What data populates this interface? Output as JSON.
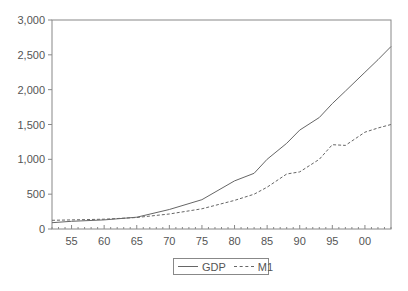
{
  "chart_data": {
    "type": "line",
    "title": "",
    "xlabel": "",
    "ylabel": "",
    "xlim": [
      1952,
      2004
    ],
    "ylim": [
      0,
      3000
    ],
    "grid": false,
    "legend_position": "bottom-center",
    "y_ticks": [
      0,
      500,
      1000,
      1500,
      2000,
      2500,
      3000
    ],
    "y_tick_labels": [
      "0",
      "500",
      "1,000",
      "1,500",
      "2,000",
      "2,500",
      "3,000"
    ],
    "x_ticks": [
      1955,
      1960,
      1965,
      1970,
      1975,
      1980,
      1985,
      1990,
      1995,
      2000
    ],
    "x_tick_labels": [
      "55",
      "60",
      "65",
      "70",
      "75",
      "80",
      "85",
      "90",
      "95",
      "00"
    ],
    "x": [
      1952,
      1955,
      1960,
      1965,
      1970,
      1975,
      1980,
      1983,
      1985,
      1988,
      1990,
      1993,
      1995,
      1997,
      2000,
      2002,
      2004
    ],
    "series": [
      {
        "name": "GDP",
        "style": "solid",
        "values": [
          90,
          110,
          130,
          170,
          280,
          420,
          690,
          800,
          1000,
          1230,
          1420,
          1600,
          1800,
          1980,
          2250,
          2430,
          2620
        ]
      },
      {
        "name": "M1",
        "style": "dashed",
        "values": [
          125,
          130,
          140,
          165,
          215,
          290,
          410,
          500,
          600,
          790,
          820,
          1000,
          1210,
          1200,
          1390,
          1450,
          1500
        ]
      }
    ]
  },
  "legend": {
    "items": [
      {
        "label": "GDP",
        "style": "solid"
      },
      {
        "label": "M1",
        "style": "dashed"
      }
    ]
  },
  "colors": {
    "line": "#666666",
    "axis": "#888888",
    "text": "#555555"
  }
}
